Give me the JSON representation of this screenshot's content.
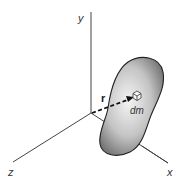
{
  "diagram": {
    "axes": {
      "x_label": "x",
      "y_label": "y",
      "z_label": "z"
    },
    "vector_label": "r",
    "element_label": "dm",
    "colors": {
      "axis": "#444444",
      "body_light": "#f2f2f2",
      "body_dark": "#6e6e6e",
      "body_outline": "#222222",
      "vector": "#111111"
    }
  }
}
